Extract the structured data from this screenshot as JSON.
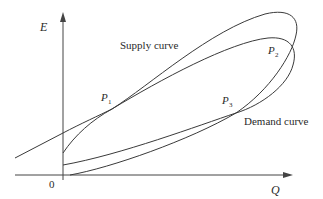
{
  "diagram": {
    "type": "supply-demand-loop",
    "axes": {
      "y_label": "E",
      "x_label": "Q",
      "origin_label": "0"
    },
    "curve_labels": {
      "supply": "Supply curve",
      "demand": "Demand curve"
    },
    "points": [
      {
        "label": "P",
        "sub": "1"
      },
      {
        "label": "P",
        "sub": "2"
      },
      {
        "label": "P",
        "sub": "3"
      }
    ],
    "colors": {
      "line": "#3a3a3a",
      "text": "#2a2a2a",
      "background": "#ffffff"
    }
  }
}
